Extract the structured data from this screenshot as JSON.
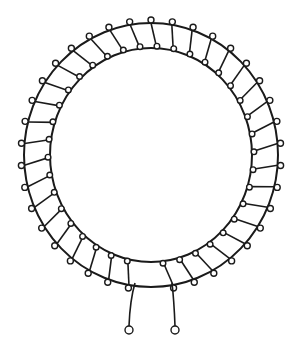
{
  "diagram": {
    "background": "#ffffff",
    "stroke_color": "#1a1a1a",
    "core": {
      "center": [
        151,
        155
      ],
      "outer_radius": [
        127,
        132
      ],
      "inner_radius": [
        101,
        107
      ]
    },
    "winding": {
      "turns": 36,
      "gap_start_deg": 80,
      "gap_end_deg": 100
    },
    "leads": [
      {
        "name": "left-lead",
        "from": [
          135,
          283
        ],
        "mid": [
          130,
          300
        ],
        "to": [
          129,
          326
        ],
        "terminal": [
          129,
          330
        ]
      },
      {
        "name": "right-lead",
        "from": [
          172,
          283
        ],
        "mid": [
          174,
          300
        ],
        "to": [
          175,
          326
        ],
        "terminal": [
          175,
          330
        ]
      }
    ],
    "terminal_radius": 4
  }
}
